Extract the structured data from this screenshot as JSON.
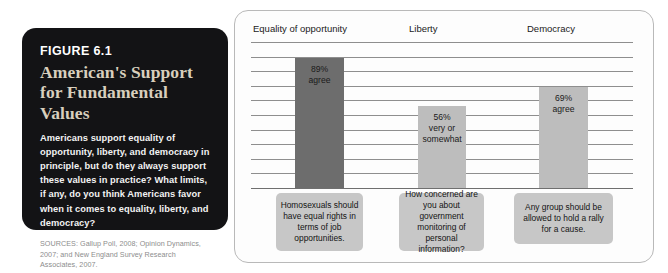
{
  "figure": {
    "number": "FIGURE 6.1",
    "title": "American's Support for Fundamental Values",
    "body": "Americans support equality of opportunity, liberty, and democracy in principle, but do they always support these values in practice? What limits, if any, do you think Americans favor when it comes to equality, liberty, and democracy?",
    "sources": "SOURCES: Gallup Poll, 2008; Opinion Dynamics, 2007; and New England Survey Research Associates, 2007.",
    "background_color": "#131315",
    "title_color": "#d8cfbd",
    "body_color": "#f2f2f2",
    "sources_color": "#8d8d8d"
  },
  "chart_data": {
    "type": "bar",
    "title": "American's Support for Fundamental Values",
    "xlabel": "",
    "ylabel": "",
    "ylim": [
      0,
      100
    ],
    "grid": true,
    "gridline_count": 10,
    "legend": "none",
    "categories": [
      "Equality of opportunity",
      "Liberty",
      "Democracy"
    ],
    "values": [
      89,
      56,
      69
    ],
    "bar_colors": [
      "#6d6d6d",
      "#bdbdbd",
      "#bdbdbd"
    ],
    "bar_labels": [
      "89%\nagree",
      "56%\nvery or\nsomewhat",
      "69%\nagree"
    ],
    "bars": [
      {
        "category": "Equality of opportunity",
        "value": 89,
        "label_line1": "89%",
        "label_line2": "agree",
        "color": "#6d6d6d",
        "question": "Homosexuals should have equal rights in terms of job opportunities."
      },
      {
        "category": "Liberty",
        "value": 56,
        "label_line1": "56%",
        "label_line2": "very or",
        "label_line3": "somewhat",
        "color": "#bdbdbd",
        "question": "How concerned are you about government monitoring of personal information?"
      },
      {
        "category": "Democracy",
        "value": 69,
        "label_line1": "69%",
        "label_line2": "agree",
        "color": "#bdbdbd",
        "question": "Any group should be allowed to hold a rally for a cause."
      }
    ],
    "caption_background": "#c7c7c7",
    "panel_background": "#fdfdfd",
    "panel_border_color": "#b9b9b9"
  }
}
